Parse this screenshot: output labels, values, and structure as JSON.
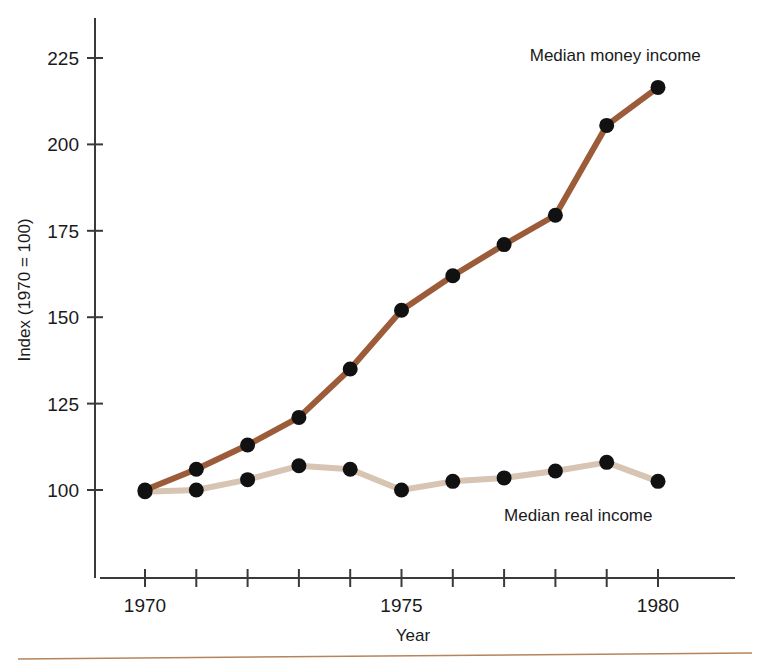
{
  "figure": {
    "background_color": "#ffffff",
    "footer_rule_color": "#b5845c"
  },
  "chart_data": {
    "type": "line",
    "title": "",
    "xlabel": "Year",
    "ylabel": "Index (1970 = 100)",
    "x": [
      1970,
      1971,
      1972,
      1973,
      1974,
      1975,
      1976,
      1977,
      1978,
      1979,
      1980
    ],
    "xlim": [
      1969.4,
      1980.6
    ],
    "ylim": [
      78,
      232
    ],
    "xticks": [
      1970,
      1971,
      1972,
      1973,
      1974,
      1975,
      1976,
      1977,
      1978,
      1979,
      1980
    ],
    "xtick_labels": [
      "1970",
      "",
      "",
      "",
      "",
      "1975",
      "",
      "",
      "",
      "",
      "1980"
    ],
    "yticks": [
      100,
      125,
      150,
      175,
      200,
      225
    ],
    "ytick_labels": [
      "100",
      "125",
      "150",
      "175",
      "200",
      "225"
    ],
    "grid": false,
    "legend_position": "inline-annotations",
    "series": [
      {
        "name": "Median money income",
        "color": "#9c5c39",
        "marker": "circle",
        "marker_color": "#111111",
        "values": [
          100,
          106,
          113,
          121,
          135,
          152,
          162,
          171,
          179.5,
          205.5,
          216.5
        ]
      },
      {
        "name": "Median real income",
        "color": "#d8c4b2",
        "marker": "circle",
        "marker_color": "#111111",
        "values": [
          99.5,
          100,
          103,
          107,
          106,
          100,
          102.5,
          103.5,
          105.5,
          108,
          102.5
        ]
      }
    ],
    "annotations": [
      {
        "text": "Median money income",
        "x": 1977.5,
        "y": 224,
        "align": "start"
      },
      {
        "text": "Median real income",
        "x": 1977.0,
        "y": 91,
        "align": "start"
      }
    ]
  }
}
